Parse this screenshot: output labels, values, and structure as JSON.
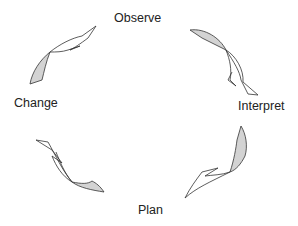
{
  "diagram": {
    "type": "cycle",
    "stages": [
      {
        "id": "observe",
        "label": "Observe"
      },
      {
        "id": "interpret",
        "label": "Interpret"
      },
      {
        "id": "plan",
        "label": "Plan"
      },
      {
        "id": "change",
        "label": "Change"
      }
    ],
    "arrows": [
      {
        "from": "Observe",
        "to": "Interpret"
      },
      {
        "from": "Interpret",
        "to": "Plan"
      },
      {
        "from": "Plan",
        "to": "Change"
      },
      {
        "from": "Change",
        "to": "Observe"
      }
    ],
    "colors": {
      "stroke": "#333333",
      "fill_light": "#ffffff",
      "fill_shaded": "#d3d3d3",
      "text": "#222222"
    }
  }
}
